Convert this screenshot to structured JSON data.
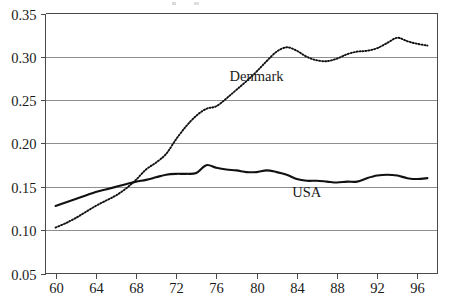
{
  "chart_data": {
    "type": "line",
    "title": "",
    "subtitle": "",
    "xlabel": "",
    "ylabel": "",
    "xlim": [
      59,
      98
    ],
    "ylim": [
      0.05,
      0.35
    ],
    "grid": true,
    "grid_axis": "y",
    "legend": "inline-annotations",
    "x_ticks": [
      60,
      64,
      68,
      72,
      76,
      80,
      84,
      88,
      92,
      96
    ],
    "x_tick_labels": [
      "60",
      "64",
      "68",
      "72",
      "76",
      "80",
      "84",
      "88",
      "92",
      "96"
    ],
    "y_ticks": [
      0.05,
      0.1,
      0.15,
      0.2,
      0.25,
      0.3,
      0.35
    ],
    "y_tick_labels": [
      "0.05",
      "0.10",
      "0.15",
      "0.20",
      "0.25",
      "0.30",
      "0.35"
    ],
    "x": [
      60,
      61,
      62,
      63,
      64,
      65,
      66,
      67,
      68,
      69,
      70,
      71,
      72,
      73,
      74,
      75,
      76,
      77,
      78,
      79,
      80,
      81,
      82,
      83,
      84,
      85,
      86,
      87,
      88,
      89,
      90,
      91,
      92,
      93,
      94,
      95,
      96,
      97
    ],
    "series": [
      {
        "name": "Denmark",
        "style": "dotted",
        "color": "#111111",
        "label_x": 80,
        "label_y": 0.272,
        "values": [
          0.103,
          0.108,
          0.114,
          0.121,
          0.128,
          0.134,
          0.14,
          0.148,
          0.158,
          0.17,
          0.178,
          0.188,
          0.205,
          0.22,
          0.232,
          0.24,
          0.243,
          0.252,
          0.262,
          0.272,
          0.283,
          0.295,
          0.306,
          0.311,
          0.307,
          0.3,
          0.296,
          0.295,
          0.298,
          0.303,
          0.306,
          0.307,
          0.31,
          0.316,
          0.322,
          0.318,
          0.315,
          0.313
        ]
      },
      {
        "name": "USA",
        "style": "solid",
        "color": "#111111",
        "label_x": 85,
        "label_y": 0.138,
        "values": [
          0.128,
          0.132,
          0.136,
          0.14,
          0.144,
          0.147,
          0.15,
          0.153,
          0.156,
          0.158,
          0.161,
          0.164,
          0.165,
          0.165,
          0.166,
          0.175,
          0.172,
          0.17,
          0.169,
          0.167,
          0.167,
          0.169,
          0.167,
          0.164,
          0.159,
          0.157,
          0.157,
          0.156,
          0.155,
          0.156,
          0.156,
          0.16,
          0.163,
          0.164,
          0.163,
          0.16,
          0.159,
          0.16
        ]
      }
    ]
  },
  "annotations": {
    "denmark_label": "Denmark",
    "usa_label": "USA"
  }
}
